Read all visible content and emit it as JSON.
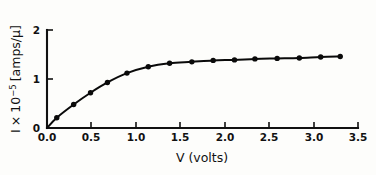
{
  "figure": {
    "background_color": "#fdfdfb",
    "ink_color": "#0a0a0a"
  },
  "chart_data": {
    "type": "line",
    "title": "",
    "subtitle": "",
    "xlabel": "V (volts)",
    "ylabel": "I × 10−5 [amps/μ]",
    "ylabel_parts": {
      "symbol": "I",
      "times": "×",
      "base": "10",
      "exponent": "−5",
      "units": "[amps/μ]"
    },
    "xlabel_parts": {
      "symbol": "V",
      "units": "(volts)"
    },
    "xlim": [
      0.0,
      3.5
    ],
    "ylim": [
      0.0,
      2.0
    ],
    "xticks": [
      0.0,
      0.5,
      1.0,
      1.5,
      2.0,
      2.5,
      3.0,
      3.5
    ],
    "xticklabels": [
      "0.0",
      "0.5",
      "1.0",
      "1.5",
      "2.0",
      "2.5",
      "3.0",
      "3.5"
    ],
    "yticks": [
      0,
      1,
      2
    ],
    "yticklabels": [
      "0",
      "1",
      "2"
    ],
    "grid": false,
    "legend": null,
    "marker": "filled-circle",
    "series": [
      {
        "name": "photocurrent",
        "x": [
          0.0,
          0.11,
          0.3,
          0.49,
          0.68,
          0.9,
          1.14,
          1.38,
          1.63,
          1.87,
          2.11,
          2.34,
          2.59,
          2.84,
          3.08,
          3.3
        ],
        "y": [
          0.0,
          0.21,
          0.48,
          0.72,
          0.93,
          1.12,
          1.25,
          1.32,
          1.35,
          1.38,
          1.39,
          1.41,
          1.42,
          1.43,
          1.45,
          1.46
        ]
      }
    ]
  }
}
